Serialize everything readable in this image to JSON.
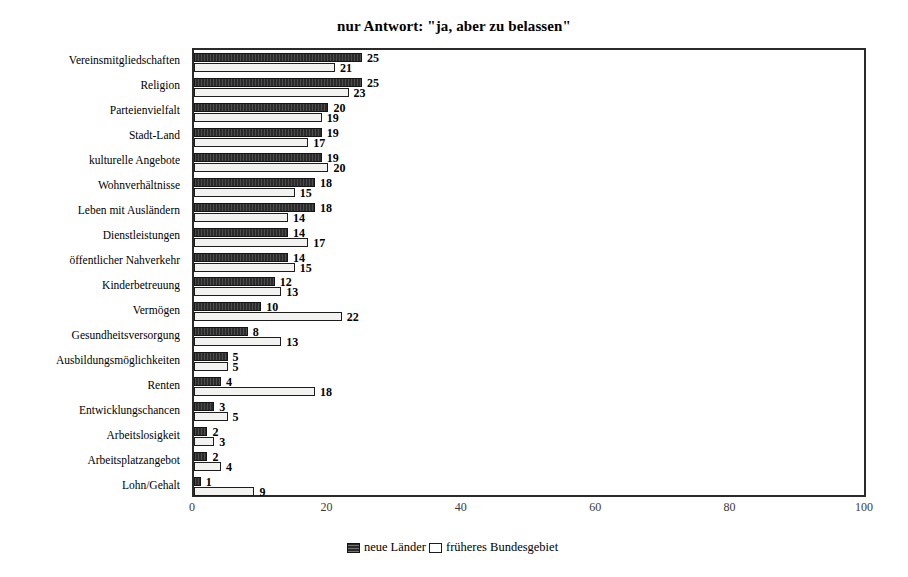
{
  "chart_data": {
    "type": "bar",
    "orientation": "horizontal",
    "title": "nur Antwort: \"ja, aber zu belassen\"",
    "xlabel": "",
    "ylabel": "",
    "xlim": [
      0,
      100
    ],
    "xticks": [
      0,
      20,
      40,
      60,
      80,
      100
    ],
    "grid": false,
    "legend_position": "bottom-center",
    "categories": [
      "Vereinsmitgliedschaften",
      "Religion",
      "Parteienvielfalt",
      "Stadt-Land",
      "kulturelle Angebote",
      "Wohnverhältnisse",
      "Leben mit Ausländern",
      "Dienstleistungen",
      "öffentlicher Nahverkehr",
      "Kinderbetreuung",
      "Vermögen",
      "Gesundheitsversorgung",
      "Ausbildungsmöglichkeiten",
      "Renten",
      "Entwicklungschancen",
      "Arbeitslosigkeit",
      "Arbeitsplatzangebot",
      "Lohn/Gehalt"
    ],
    "series": [
      {
        "name": "neue Länder",
        "color": "#2b2b2b",
        "values": [
          25,
          25,
          20,
          19,
          19,
          18,
          18,
          14,
          14,
          12,
          10,
          8,
          5,
          4,
          3,
          2,
          2,
          1
        ]
      },
      {
        "name": "früheres Bundesgebiet",
        "color": "#ffffff",
        "values": [
          21,
          23,
          19,
          17,
          20,
          15,
          14,
          17,
          15,
          13,
          22,
          13,
          5,
          18,
          5,
          3,
          4,
          9
        ]
      }
    ]
  }
}
